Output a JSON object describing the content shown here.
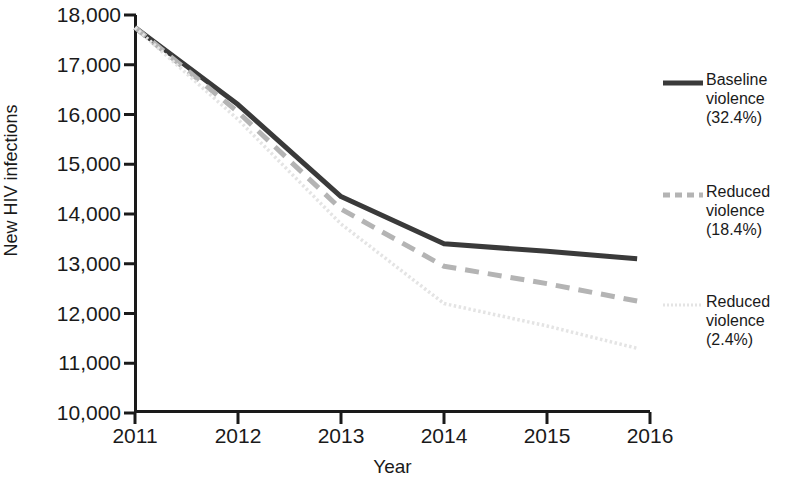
{
  "figure": {
    "title_partial": "",
    "background": "#ffffff"
  },
  "axes": {
    "y_label": "New HIV infections",
    "x_label": "Year",
    "y_ticks": [
      "10,000",
      "11,000",
      "12,000",
      "13,000",
      "14,000",
      "15,000",
      "16,000",
      "17,000",
      "18,000"
    ],
    "x_ticks": [
      "2011",
      "2012",
      "2013",
      "2014",
      "2015",
      "2016"
    ]
  },
  "legend": {
    "items": [
      {
        "label_line1": "Baseline",
        "label_line2": "violence",
        "label_line3": "(32.4%)",
        "style": "solid",
        "color": "#3a3a3a"
      },
      {
        "label_line1": "Reduced",
        "label_line2": "violence",
        "label_line3": "(18.4%)",
        "style": "dashed",
        "color": "#b4b4b4"
      },
      {
        "label_line1": "Reduced",
        "label_line2": "violence",
        "label_line3": "(2.4%)",
        "style": "dotted",
        "color": "#e4e4e4"
      }
    ]
  },
  "chart_data": {
    "type": "line",
    "title": "",
    "xlabel": "Year",
    "ylabel": "New HIV infections",
    "x": [
      2011,
      2012,
      2013,
      2014,
      2015,
      2016
    ],
    "xlim": [
      2011,
      2016
    ],
    "ylim": [
      10000,
      18000
    ],
    "ytick_values": [
      10000,
      11000,
      12000,
      13000,
      14000,
      15000,
      16000,
      17000,
      18000
    ],
    "grid": false,
    "legend_position": "right",
    "series": [
      {
        "name": "Baseline violence (32.4%)",
        "values": [
          17750,
          16200,
          14350,
          13400,
          13250,
          13100
        ],
        "color": "#3a3a3a",
        "style": "solid"
      },
      {
        "name": "Reduced violence (18.4%)",
        "values": [
          17750,
          16050,
          14100,
          12950,
          12600,
          12250
        ],
        "color": "#b4b4b4",
        "style": "dashed"
      },
      {
        "name": "Reduced violence (2.4%)",
        "values": [
          17750,
          15900,
          13800,
          12200,
          11750,
          11300
        ],
        "color": "#e4e4e4",
        "style": "dotted"
      }
    ]
  }
}
